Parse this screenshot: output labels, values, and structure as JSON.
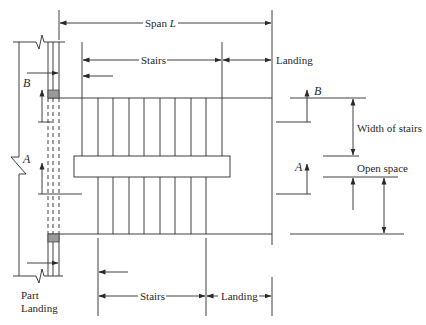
{
  "diagram": {
    "labels": {
      "span": "Span",
      "span_symbol": "L",
      "stairs_top": "Stairs",
      "landing_top": "Landing",
      "stairs_bottom": "Stairs",
      "landing_bottom": "Landing",
      "width_of_stairs": "Width of stairs",
      "open_space": "Open space",
      "part_landing_1": "Part",
      "part_landing_2": "Landing",
      "section_b_left": "B",
      "section_a_left": "A",
      "section_b_right": "B",
      "section_a_right": "A"
    },
    "colors": {
      "line": "#2a2a2a",
      "bearing_fill": "#9a9a9a",
      "background": "#ffffff"
    },
    "geometry": {
      "top_flight_risers": 10,
      "bottom_flight_risers": 8
    }
  }
}
